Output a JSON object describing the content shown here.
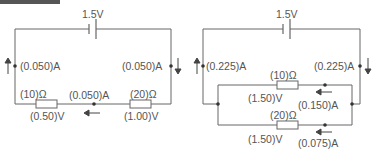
{
  "header": {
    "label": ""
  },
  "circuits": [
    {
      "name": "series",
      "battery": "1.5V",
      "current_left": "(0.050)A",
      "current_right": "(0.050)A",
      "current_bottom": "(0.050)A",
      "resistors": [
        {
          "resistance": "(10)Ω",
          "voltage": "(0.50)V"
        },
        {
          "resistance": "(20)Ω",
          "voltage": "(1.00)V"
        }
      ]
    },
    {
      "name": "parallel",
      "battery": "1.5V",
      "current_left": "(0.225)A",
      "current_right": "(0.225)A",
      "branches": [
        {
          "resistance": "(10)Ω",
          "voltage": "(1.50)V",
          "current": "(0.150)A"
        },
        {
          "resistance": "(20)Ω",
          "voltage": "(1.50)V",
          "current": "(0.075)A"
        }
      ]
    }
  ],
  "colors": {
    "wire": "#666666",
    "text": "#555555"
  }
}
